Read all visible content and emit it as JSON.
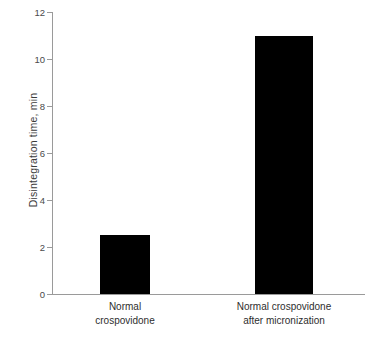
{
  "chart_data": {
    "type": "bar",
    "title": "",
    "xlabel": "",
    "ylabel": "Disintegration  time, min",
    "categories": [
      "Normal crospovidone",
      "Normal crospovidone after micronization"
    ],
    "category_lines": [
      [
        "Normal",
        "crospovidone"
      ],
      [
        "Normal crospovidone",
        "after micronization"
      ],
      [
        "",
        ""
      ]
    ],
    "values": [
      2.5,
      11.0
    ],
    "ylim": [
      0,
      12
    ],
    "yticks": [
      0,
      2,
      4,
      6,
      8,
      10,
      12
    ],
    "ytick_labels": [
      "0",
      "2",
      "4",
      "6",
      "8",
      "10",
      "12"
    ],
    "grid": false,
    "legend": false,
    "bar_color": "#000000",
    "axis_color": "#9a9a9a",
    "text_color": "#2e2e2e"
  },
  "axis": {
    "y_title": "Disintegration  time, min"
  },
  "ticks": {
    "t0": "0",
    "t1": "2",
    "t2": "4",
    "t3": "6",
    "t4": "8",
    "t5": "10",
    "t6": "12"
  },
  "categories": {
    "c0_line0": "Normal",
    "c0_line1": "crospovidone",
    "c1_line0": "Normal crospovidone",
    "c1_line1": "after micronization"
  }
}
